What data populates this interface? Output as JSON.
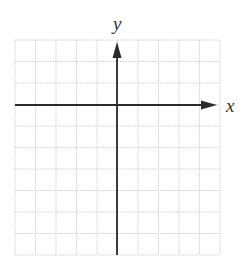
{
  "diagram": {
    "type": "coordinate-grid",
    "grid": {
      "columns": 10,
      "rows": 10,
      "left": 15,
      "top": 40,
      "right": 220,
      "bottom": 255,
      "line_color": "#d0d0d0",
      "line_style": "dotted"
    },
    "axes": {
      "color": "#2a2a2a",
      "origin_px": [
        117,
        105
      ],
      "x_axis": {
        "label": "x",
        "arrow": "right-only",
        "x_start": 15,
        "x_end": 217,
        "y": 105
      },
      "y_axis": {
        "label": "y",
        "arrow": "up-only",
        "y_start": 255,
        "y_end": 42,
        "x": 117
      }
    }
  },
  "labels": {
    "x_label": "x",
    "y_label": "y"
  }
}
